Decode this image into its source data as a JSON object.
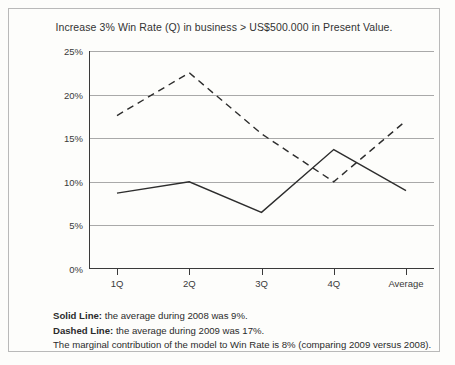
{
  "chart_data": {
    "type": "line",
    "title": "Increase 3% Win Rate (Q) in business > US$500.000 in Present Value.",
    "xlabel": "",
    "ylabel": "",
    "categories": [
      "1Q",
      "2Q",
      "3Q",
      "4Q",
      "Average"
    ],
    "ylim": [
      0,
      25
    ],
    "ytick_labels": [
      "0%",
      "5%",
      "10%",
      "15%",
      "20%",
      "25%"
    ],
    "ytick_values": [
      0,
      5,
      10,
      15,
      20,
      25
    ],
    "grid": "horizontal",
    "legend": "none",
    "series": [
      {
        "name": "Solid Line",
        "style": "solid",
        "color": "#2d2d2d",
        "values": [
          8.7,
          10.0,
          6.5,
          13.7,
          9.0
        ]
      },
      {
        "name": "Dashed Line",
        "style": "dashed",
        "color": "#2d2d2d",
        "values": [
          17.6,
          22.5,
          15.5,
          10.0,
          17.0
        ]
      }
    ]
  },
  "footnote": {
    "line1_lead": "Solid Line:",
    "line1_text": " the average during 2008 was 9%.",
    "line2_lead": "Dashed Line:",
    "line2_text": " the average during 2009 was 17%.",
    "line3_text": "The marginal contribution of the model to Win Rate is 8% (comparing 2009 versus 2008)."
  }
}
